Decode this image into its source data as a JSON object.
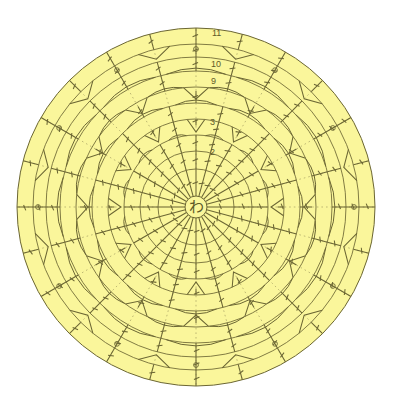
{
  "document": {
    "title": "Crochet Round Motif Chart",
    "kind": "japanese-crochet-chart",
    "background_color": "#ffffff"
  },
  "canvas": {
    "width": 393,
    "height": 418
  },
  "motif": {
    "center": {
      "x": 196,
      "y": 207
    },
    "fill_color": "#faf69b",
    "line_color": "#6b6633",
    "outer_radius": 179,
    "center_symbol": "わ",
    "center_symbol_name": "magic-ring",
    "center_ring_radius": 11
  },
  "round_labels": [
    {
      "text": "11",
      "x": 212,
      "y": 36
    },
    {
      "text": "10",
      "x": 211,
      "y": 67
    },
    {
      "text": "9",
      "x": 211,
      "y": 84
    },
    {
      "text": "3",
      "x": 210,
      "y": 125
    },
    {
      "text": "2",
      "x": 210,
      "y": 155
    }
  ],
  "chart_data": {
    "type": "diagram",
    "center_marker": "わ",
    "rounds": [
      {
        "n": 1,
        "radius": 11,
        "spokes": 24,
        "style": "magic-ring"
      },
      {
        "n": 2,
        "radius": 38,
        "spokes": 24,
        "style": "dc-post"
      },
      {
        "n": 3,
        "radius": 56,
        "spokes": 24,
        "style": "dc-post"
      },
      {
        "n": 4,
        "radius": 72,
        "spokes": 24,
        "style": "dc-fan"
      },
      {
        "n": 5,
        "radius": 88,
        "spokes": 12,
        "style": "cluster-triangle"
      },
      {
        "n": 6,
        "radius": 104,
        "spokes": 12,
        "style": "chain-arc"
      },
      {
        "n": 7,
        "radius": 120,
        "spokes": 12,
        "style": "cluster-triangle"
      },
      {
        "n": 8,
        "radius": 136,
        "spokes": 12,
        "style": "chain-arc"
      },
      {
        "n": 9,
        "radius": 150,
        "spokes": 12,
        "style": "dc-post"
      },
      {
        "n": 10,
        "radius": 163,
        "spokes": 12,
        "style": "picot-chain"
      },
      {
        "n": 11,
        "radius": 179,
        "spokes": 24,
        "style": "dc-edge"
      }
    ],
    "ring_radii": [
      11,
      38,
      56,
      72,
      88,
      104,
      120,
      136,
      150,
      163,
      179
    ],
    "legend": [],
    "grid": false
  }
}
